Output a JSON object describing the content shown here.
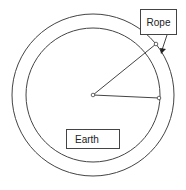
{
  "diagram": {
    "labels": {
      "rope": "Rope",
      "earth": "Earth"
    },
    "colors": {
      "stroke": "#444444",
      "background": "#ffffff"
    },
    "geometry": {
      "center": [
        93,
        95
      ],
      "outer_radius": 81,
      "inner_radius": 67,
      "point_top": [
        156,
        44
      ],
      "point_right": [
        159,
        98
      ]
    }
  }
}
